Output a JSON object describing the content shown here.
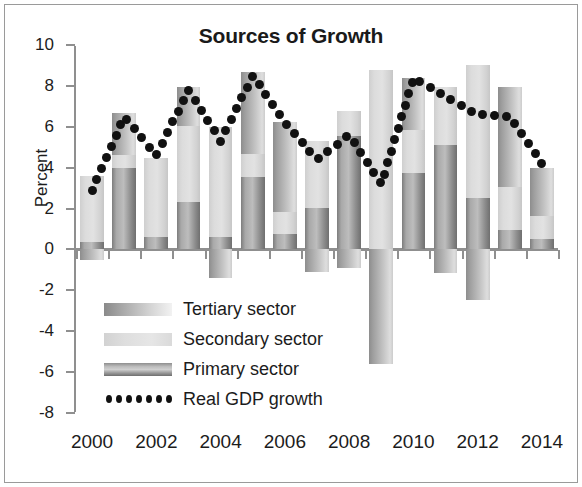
{
  "chart_data": {
    "type": "bar",
    "title": "Sources of Growth",
    "xlabel": "",
    "ylabel": "Percent",
    "ylim": [
      -8,
      10
    ],
    "ytick_step": 2,
    "ytick_labels": [
      "10",
      "8",
      "6",
      "4",
      "2",
      "0",
      "-2",
      "-4",
      "-6",
      "-8"
    ],
    "yticks": [
      10,
      8,
      6,
      4,
      2,
      0,
      -2,
      -4,
      -6,
      -8
    ],
    "grid": false,
    "legend_position": "inside-lower-left",
    "stacked": true,
    "categories": [
      "2000",
      "2001",
      "2002",
      "2003",
      "2004",
      "2005",
      "2006",
      "2007",
      "2008",
      "2009",
      "2010",
      "2011",
      "2012",
      "2013",
      "2014"
    ],
    "xtick_labels": [
      "2000",
      "2002",
      "2004",
      "2006",
      "2008",
      "2010",
      "2012",
      "2014"
    ],
    "xtick_categories": [
      "2000",
      "2002",
      "2004",
      "2006",
      "2008",
      "2010",
      "2012",
      "2014"
    ],
    "series": [
      {
        "name": "Primary sector",
        "kind": "bar",
        "color": "#b0b0b0",
        "values": [
          0.35,
          4.0,
          0.6,
          2.3,
          0.6,
          3.55,
          0.75,
          2.05,
          5.55,
          0.0,
          3.75,
          5.1,
          2.5,
          0.95,
          0.5
        ]
      },
      {
        "name": "Secondary sector",
        "kind": "bar",
        "color": "#dcdcdc",
        "values": [
          3.25,
          0.6,
          3.85,
          3.75,
          5.4,
          1.1,
          1.1,
          3.25,
          1.2,
          8.8,
          2.1,
          2.85,
          6.5,
          2.1,
          1.15
        ]
      },
      {
        "name": "Tertiary sector",
        "kind": "bar",
        "color": "#a8a8a8",
        "values": [
          -0.5,
          2.05,
          0.0,
          1.9,
          -1.4,
          4.05,
          4.4,
          -1.1,
          -0.9,
          -5.6,
          2.55,
          -1.15,
          -2.45,
          4.9,
          2.35
        ]
      },
      {
        "name": "Real GDP growth",
        "kind": "line",
        "style": "dotted",
        "color": "#111111",
        "values": [
          2.9,
          6.5,
          4.6,
          7.8,
          5.3,
          8.5,
          6.2,
          4.4,
          5.6,
          3.2,
          8.4,
          7.5,
          6.6,
          6.5,
          4.2
        ]
      }
    ]
  },
  "legend": {
    "items": [
      {
        "label": "Tertiary sector",
        "swatch": "tertiary"
      },
      {
        "label": "Secondary sector",
        "swatch": "secondary"
      },
      {
        "label": "Primary sector",
        "swatch": "primary"
      },
      {
        "label": "Real GDP growth",
        "swatch": "dots"
      }
    ]
  }
}
